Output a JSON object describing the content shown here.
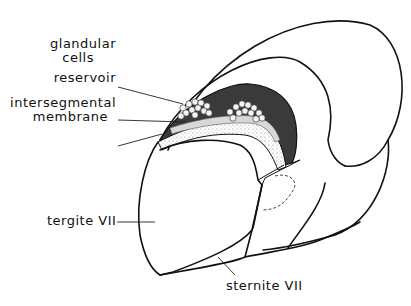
{
  "figure": {
    "type": "anatomical line drawing",
    "colors": {
      "line": "#111111",
      "gland_dark": "#3a3a3a",
      "stipple": "#e6e6e6",
      "background": "#ffffff"
    }
  },
  "labels": {
    "glandular_cells_line1": "glandular",
    "glandular_cells_line2": "cells",
    "reservoir": "reservoir",
    "intersegmental_line1": "intersegmental",
    "intersegmental_line2": "membrane",
    "tergite": "tergite VII",
    "sternite": "sternite VII"
  }
}
